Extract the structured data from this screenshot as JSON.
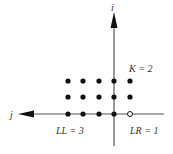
{
  "diagram": {
    "axes": {
      "vertical_label": "i",
      "horizontal_label": "j"
    },
    "labels": {
      "k": "K = 2",
      "ll": "LL = 3",
      "lr": "LR = 1"
    },
    "grid": {
      "columns": 5,
      "rows": 3,
      "filled_points": 14,
      "open_points": 1,
      "open_point_position": "rightmost on horizontal axis"
    },
    "colors": {
      "ink": "#111111",
      "axis": "#555555",
      "background": "#ffffff"
    }
  }
}
